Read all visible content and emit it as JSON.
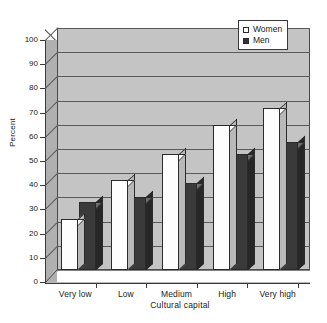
{
  "chart_data": {
    "type": "bar",
    "title": "",
    "xlabel": "Cultural capital",
    "ylabel": "Percent",
    "categories": [
      "Very low",
      "Low",
      "Medium",
      "High",
      "Very high"
    ],
    "series": [
      {
        "name": "Women",
        "values": [
          21,
          37,
          48,
          60,
          67
        ],
        "color": "#ffffff"
      },
      {
        "name": "Men",
        "values": [
          28,
          30,
          36,
          48,
          53
        ],
        "color": "#333333"
      }
    ],
    "ylim": [
      0,
      100
    ],
    "yticks": [
      0,
      10,
      20,
      30,
      40,
      50,
      60,
      70,
      80,
      90,
      100
    ],
    "ytick_labels": [
      "0",
      "10",
      "20",
      "30",
      "40",
      "50",
      "60",
      "70",
      "80",
      "90",
      "100"
    ],
    "grid": true,
    "legend_position": "top-right",
    "style": "3d-column",
    "plot_background": "#c4c4c4"
  },
  "legend": {
    "entries": [
      {
        "label": "Women",
        "swatch": "white-square"
      },
      {
        "label": "Men",
        "swatch": "dark-square"
      }
    ]
  },
  "axes": {
    "y_title": "Percent",
    "x_title": "Cultural capital"
  }
}
